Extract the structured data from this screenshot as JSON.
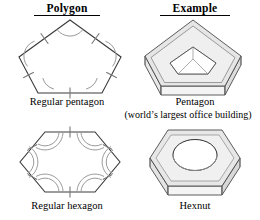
{
  "headers": {
    "polygon": "Polygon",
    "example": "Example"
  },
  "rows": [
    {
      "polygon_caption": "Regular pentagon",
      "example_caption": "Pentagon",
      "example_subcaption": "(world’s largest office building)",
      "polygon_shape": "regular-pentagon",
      "example_shape": "pentagon-building",
      "sides": 5,
      "tick_marks": 1,
      "angle_arcs": 1
    },
    {
      "polygon_caption": "Regular hexagon",
      "example_caption": "Hexnut",
      "example_subcaption": "",
      "polygon_shape": "regular-hexagon",
      "example_shape": "hexnut",
      "sides": 6,
      "tick_marks": 1,
      "angle_arcs": 2
    }
  ],
  "colors": {
    "outline": "#3a3a3a",
    "mark": "#8a8a8a",
    "face_top": "#e4e4e4",
    "face_bevel": "#d0d0d0",
    "face_side": "#f2f2f2",
    "face_inner": "#ffffff",
    "text": "#000000"
  }
}
